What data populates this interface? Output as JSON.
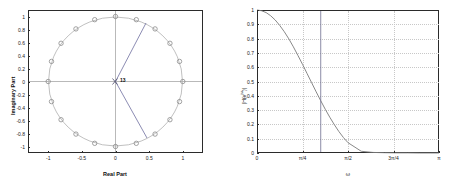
{
  "figure": {
    "background": "#ffffff",
    "axis_color": "#2b2b2b",
    "grid_color": "#b9b9b9",
    "marker_color": "#8a8a8a",
    "line_color": "#6f6f9f"
  },
  "chart_data": [
    {
      "type": "scatter",
      "name": "pole-zero-plot",
      "title": "",
      "xlabel": "Real Part",
      "ylabel": "Imaginary Part",
      "xlim": [
        -1.3,
        1.3
      ],
      "ylim": [
        -1.1,
        1.1
      ],
      "xticks": [
        -1,
        -0.5,
        0,
        0.5,
        1
      ],
      "xticklabels": [
        "-1",
        "-0.5",
        "0",
        "0.5",
        "1"
      ],
      "yticks": [
        -1,
        -0.8,
        -0.6,
        -0.4,
        -0.2,
        0,
        0.2,
        0.4,
        0.6,
        0.8,
        1
      ],
      "yticklabels": [
        "-1",
        "-0.8",
        "-0.6",
        "-0.4",
        "-0.2",
        "0",
        "0.2",
        "0.4",
        "0.6",
        "0.8",
        "1"
      ],
      "grid": false,
      "legend": "none",
      "unit_circle": {
        "radius": 1.0,
        "center": [
          0,
          0
        ]
      },
      "annotations": [
        {
          "text": "13",
          "x": 0.04,
          "y": 0.03,
          "name": "pole-multiplicity-label"
        }
      ],
      "marker_style": "o",
      "series": [
        {
          "name": "zeros",
          "marker": "o",
          "points": [
            [
              1.0,
              0.0
            ],
            [
              0.9511,
              0.309
            ],
            [
              0.809,
              0.5878
            ],
            [
              0.5878,
              0.809
            ],
            [
              0.309,
              0.9511
            ],
            [
              0.0,
              1.0
            ],
            [
              -0.309,
              0.9511
            ],
            [
              -0.5878,
              0.809
            ],
            [
              -0.809,
              0.5878
            ],
            [
              -0.9511,
              0.309
            ],
            [
              -1.0,
              0.0
            ],
            [
              -0.9511,
              -0.309
            ],
            [
              -0.809,
              -0.5878
            ],
            [
              -0.5878,
              -0.809
            ],
            [
              -0.309,
              -0.9511
            ],
            [
              0.0,
              -1.0
            ],
            [
              0.309,
              -0.9511
            ],
            [
              0.5878,
              -0.809
            ],
            [
              0.809,
              -0.5878
            ],
            [
              0.9511,
              -0.309
            ]
          ]
        },
        {
          "name": "multiple-pole-at-origin",
          "marker": "x",
          "multiplicity": 13,
          "points": [
            [
              0.0,
              0.0
            ]
          ]
        }
      ],
      "sector_lines": [
        {
          "from": [
            0,
            0
          ],
          "to": [
            0.45,
            0.9
          ]
        },
        {
          "from": [
            0,
            0
          ],
          "to": [
            0.47,
            -0.88
          ]
        }
      ]
    },
    {
      "type": "line",
      "name": "magnitude-response-plot",
      "title": "",
      "xlabel": "ω",
      "ylabel": "|H(e^{jω})|",
      "xlim": [
        0,
        3.14159
      ],
      "ylim": [
        0,
        1
      ],
      "xticks": [
        0,
        0.7854,
        1.5708,
        2.3562,
        3.14159
      ],
      "xticklabels": [
        "0",
        "π/4",
        "π/2",
        "3π/4",
        "π"
      ],
      "yticks": [
        0,
        0.1,
        0.2,
        0.3,
        0.4,
        0.5,
        0.6,
        0.7,
        0.8,
        0.9,
        1
      ],
      "yticklabels": [
        "0",
        "0.1",
        "0.2",
        "0.3",
        "0.4",
        "0.5",
        "0.6",
        "0.7",
        "0.8",
        "0.9",
        "1"
      ],
      "grid": true,
      "legend": "none",
      "x": [
        0.0,
        0.0785,
        0.1571,
        0.2356,
        0.3142,
        0.3927,
        0.4712,
        0.5498,
        0.6283,
        0.7069,
        0.7854,
        0.8639,
        0.9425,
        1.021,
        1.0996,
        1.1781,
        1.2566,
        1.3352,
        1.4137,
        1.4923,
        1.5708,
        1.8,
        2.0,
        2.2,
        2.4,
        2.6,
        2.8,
        3.0,
        3.14159
      ],
      "values": [
        1.0,
        0.995,
        0.982,
        0.96,
        0.93,
        0.892,
        0.848,
        0.798,
        0.742,
        0.682,
        0.62,
        0.556,
        0.492,
        0.428,
        0.366,
        0.306,
        0.25,
        0.198,
        0.15,
        0.108,
        0.072,
        0.012,
        0.004,
        0.002,
        0.001,
        0.001,
        0.0,
        0.0,
        0.0
      ],
      "vertical_markers": [
        {
          "name": "cutoff-line",
          "x": 1.1,
          "label": ""
        }
      ]
    }
  ]
}
